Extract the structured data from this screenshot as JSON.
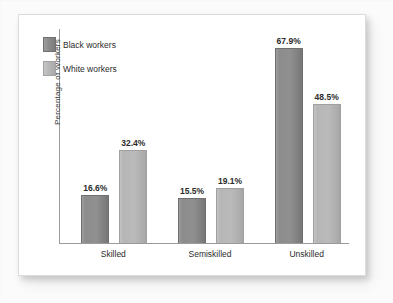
{
  "chart_data": {
    "type": "bar",
    "title": "",
    "subtitle": "",
    "xlabel": "",
    "ylabel": "Percentage of Workers",
    "categories": [
      "Skilled",
      "Semiskilled",
      "Unskilled"
    ],
    "series": [
      {
        "name": "Black workers",
        "color": "#8c8c8c",
        "values": [
          16.6,
          15.5,
          67.9
        ],
        "labels": [
          "16.6%",
          "15.5%",
          "67.9%"
        ]
      },
      {
        "name": "White workers",
        "color": "#b8b8b8",
        "values": [
          32.4,
          19.1,
          48.5
        ],
        "labels": [
          "32.4%",
          "19.1%",
          "48.5%"
        ]
      }
    ],
    "ylim": [
      0,
      75
    ],
    "grid": false,
    "legend_position": "upper-left-inside",
    "axis_color": "#9a9a9a"
  },
  "legend": {
    "items": [
      {
        "label": "Black workers"
      },
      {
        "label": "White workers"
      }
    ]
  },
  "axes": {
    "y_title": "Percentage of Workers"
  }
}
